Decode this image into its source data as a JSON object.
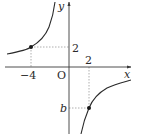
{
  "diagram": {
    "type": "function-graph",
    "function_description": "hyperbola y = k/x passing through (-4, 2) and (2, b)",
    "axes": {
      "x_label": "x",
      "y_label": "y",
      "origin_label": "O"
    },
    "tick_labels": {
      "x_neg": "−4",
      "x_pos": "2",
      "y_pos": "2",
      "y_neg": "b"
    },
    "points": [
      {
        "name": "point-a",
        "x": -4,
        "y": 2
      },
      {
        "name": "point-b",
        "x": 2,
        "y": "b"
      }
    ],
    "colors": {
      "curve": "#2a2a2a",
      "axis": "#3a3a3a",
      "guide": "#9a9a9a",
      "point": "#1a1a1a"
    }
  }
}
